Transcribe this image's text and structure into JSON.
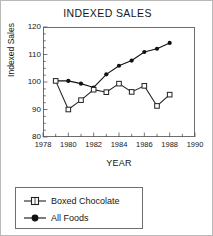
{
  "chart_data": {
    "type": "line",
    "title": "INDEXED SALES",
    "xlabel": "YEAR",
    "ylabel": "Indexed Sales",
    "xlim": [
      1978,
      1990
    ],
    "ylim": [
      80,
      120
    ],
    "xticks": [
      1978,
      1980,
      1982,
      1984,
      1986,
      1988,
      1990
    ],
    "xtick_labels": [
      "1978",
      "1980",
      "1982",
      "1984",
      "1986",
      "1988",
      "1990"
    ],
    "minor_xtick_step": 1,
    "yticks": [
      80,
      90,
      100,
      110,
      120
    ],
    "ytick_labels": [
      "80",
      "90",
      "100",
      "110",
      "120"
    ],
    "minor_ytick_step": 2.5,
    "grid": false,
    "legend_position": "below-axes-left",
    "x": [
      1979,
      1980,
      1981,
      1982,
      1983,
      1984,
      1985,
      1986,
      1987,
      1988
    ],
    "series": [
      {
        "name": "Boxed Chocolate",
        "marker": "open-square",
        "color": "#222222",
        "values": [
          100.4,
          90.0,
          93.4,
          97.2,
          96.3,
          99.4,
          96.4,
          98.6,
          91.3,
          95.4
        ]
      },
      {
        "name": "All Foods",
        "marker": "filled-circle",
        "color": "#111111",
        "values": [
          100.4,
          100.4,
          99.4,
          98.0,
          102.8,
          105.9,
          107.8,
          110.9,
          112.1,
          114.2
        ]
      }
    ]
  },
  "legend": {
    "items": [
      {
        "label": "Boxed Chocolate",
        "marker": "open-square"
      },
      {
        "label": "All Foods",
        "marker": "filled-circle"
      }
    ]
  }
}
